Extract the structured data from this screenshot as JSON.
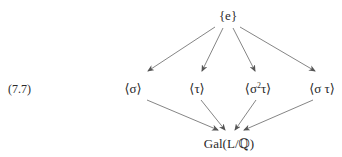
{
  "equation_number": "(7.7)",
  "nodes": {
    "top": "{e}",
    "sigma": "⟨σ⟩",
    "tau": "⟨τ⟩",
    "sigma2tau_base": "⟨σ",
    "sigma2tau_exp": "2",
    "sigma2tau_tail": "τ⟩",
    "sigmatau": "⟨σ τ⟩",
    "bottom": "Gal(L/ℚ)"
  },
  "edges": [
    {
      "from": "top",
      "to": "sigma"
    },
    {
      "from": "top",
      "to": "tau"
    },
    {
      "from": "top",
      "to": "sigma2tau"
    },
    {
      "from": "top",
      "to": "sigmatau"
    },
    {
      "from": "sigma",
      "to": "bottom"
    },
    {
      "from": "tau",
      "to": "bottom"
    },
    {
      "from": "sigma2tau",
      "to": "bottom"
    },
    {
      "from": "sigmatau",
      "to": "bottom"
    }
  ],
  "colors": {
    "text": "#2a2a2a",
    "arrow": "#555555"
  }
}
